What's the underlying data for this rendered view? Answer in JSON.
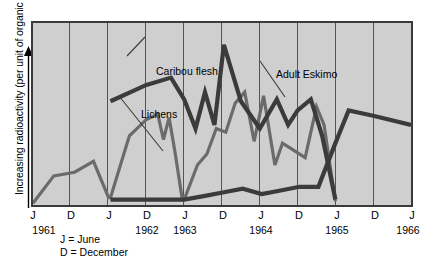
{
  "axes": {
    "ylabel": "Increasing radioactivity (per unit of organic matter)",
    "y_arrow_icon": "up-arrow-icon",
    "xticks": [
      {
        "label": "J",
        "year": "1961"
      },
      {
        "label": "D",
        "year": ""
      },
      {
        "label": "J",
        "year": ""
      },
      {
        "label": "D",
        "year": "1962"
      },
      {
        "label": "J",
        "year": "1963"
      },
      {
        "label": "D",
        "year": ""
      },
      {
        "label": "J",
        "year": "1964"
      },
      {
        "label": "D",
        "year": ""
      },
      {
        "label": "J",
        "year": "1965"
      },
      {
        "label": "D",
        "year": ""
      },
      {
        "label": "J",
        "year": "1966"
      }
    ]
  },
  "legend": {
    "line1": "J = June",
    "line2": "D = December"
  },
  "annotations": [
    {
      "name": "caribou-flesh",
      "text": "Caribou flesh"
    },
    {
      "name": "lichens",
      "text": "Lichens"
    },
    {
      "name": "adult-eskimo",
      "text": "Adult Eskimo"
    }
  ],
  "colors": {
    "plot_background": "#cfcfcf",
    "frame": "#3a3a3a",
    "gridline": "#555555",
    "caribou": "#3b3b3b",
    "lichens": "#6b6b6b",
    "eskimo": "#3b3b3b",
    "page_background": "#ffffff"
  },
  "chart_data": {
    "type": "line",
    "title": "",
    "xlabel": "",
    "ylabel": "Increasing radioactivity (per unit of organic matter)",
    "grid": true,
    "legend_position": "inline-annotations",
    "xlim": [
      0,
      10
    ],
    "ylim": [
      0,
      100
    ],
    "x_tick_labels": [
      "J",
      "D",
      "J",
      "D",
      "J",
      "D",
      "J",
      "D",
      "J",
      "D",
      "J"
    ],
    "x_tick_years": [
      "1961",
      "",
      "",
      "1962",
      "1963",
      "",
      "1964",
      "",
      "1965",
      "",
      "1966"
    ],
    "note": "x index 0 = June 1961, each step = 6 months; y is a relative unlabeled radioactivity scale 0-100",
    "series": [
      {
        "name": "Lichens",
        "color": "#6b6b6b",
        "x": [
          0.0,
          0.55,
          1.1,
          1.6,
          2.0,
          2.05,
          2.55,
          3.0,
          3.3,
          3.45,
          3.6,
          3.75,
          3.95,
          4.0,
          4.35,
          4.6,
          4.85,
          5.1,
          5.35,
          5.6,
          5.85,
          6.1,
          6.4,
          6.6,
          6.9,
          7.2,
          7.5,
          7.7,
          8.0
        ],
        "values": [
          1,
          16,
          18,
          24,
          4,
          4,
          38,
          47,
          50,
          36,
          48,
          30,
          3,
          3,
          22,
          28,
          42,
          40,
          56,
          62,
          35,
          60,
          22,
          34,
          30,
          26,
          54,
          44,
          2
        ]
      },
      {
        "name": "Caribou flesh",
        "color": "#3b3b3b",
        "x": [
          2.05,
          3.0,
          3.65,
          4.0,
          4.3,
          4.55,
          4.8,
          5.05,
          5.5,
          6.0,
          6.45,
          6.75,
          7.0,
          7.35,
          7.65,
          8.0
        ],
        "values": [
          57,
          66,
          70,
          58,
          42,
          62,
          44,
          88,
          57,
          42,
          58,
          44,
          52,
          58,
          38,
          3
        ]
      },
      {
        "name": "Adult Eskimo",
        "color": "#3b3b3b",
        "x": [
          2.05,
          3.0,
          4.0,
          4.55,
          5.05,
          5.55,
          6.05,
          6.55,
          7.05,
          7.55,
          8.0,
          8.35,
          9.0,
          10.0
        ],
        "values": [
          3,
          3,
          3,
          5,
          7,
          9,
          6,
          8,
          10,
          10,
          34,
          52,
          49,
          44
        ]
      }
    ]
  }
}
